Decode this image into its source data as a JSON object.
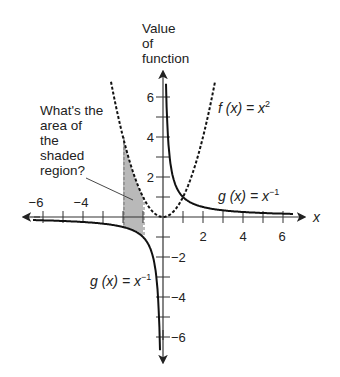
{
  "chart_data": {
    "type": "line",
    "title": "",
    "xlabel": "x",
    "ylabel": "Value of function",
    "ylabel_lines": [
      "Value",
      "of",
      "function"
    ],
    "xlim": [
      -7,
      7
    ],
    "ylim": [
      -7,
      7
    ],
    "x_tick_labels": [
      "-6",
      "-4",
      "2",
      "4",
      "6"
    ],
    "x_tick_values": [
      -6,
      -4,
      2,
      4,
      6
    ],
    "y_tick_labels": [
      "6",
      "4",
      "2",
      "-2",
      "-4",
      "-6"
    ],
    "y_tick_values": [
      6,
      4,
      2,
      -2,
      -4,
      -6
    ],
    "grid": false,
    "series": [
      {
        "name": "f(x) = x^2",
        "label_main": "f (x) = x",
        "label_sup": "2",
        "style": "dashed",
        "domain": [
          -2.6,
          2.6
        ],
        "x": [
          -2.6,
          -2,
          -1.5,
          -1,
          -0.5,
          0,
          0.5,
          1,
          1.5,
          2,
          2.6
        ],
        "values": [
          6.76,
          4,
          2.25,
          1,
          0.25,
          0,
          0.25,
          1,
          2.25,
          4,
          6.76
        ]
      },
      {
        "name": "g(x) = x^-1",
        "label_main": "g (x) = x",
        "label_sup": "−1",
        "style": "solid",
        "domain": [
          [
            -6.5,
            -0.15
          ],
          [
            0.15,
            6.5
          ]
        ],
        "x": [
          -6.5,
          -4,
          -2,
          -1,
          -0.5,
          -0.15,
          0.15,
          0.5,
          1,
          2,
          4,
          6.5
        ],
        "values": [
          -0.154,
          -0.25,
          -0.5,
          -1,
          -2,
          -6.67,
          6.67,
          2,
          1,
          0.5,
          0.25,
          0.154
        ]
      }
    ],
    "shaded_region": {
      "x_from": -2,
      "x_to": -1,
      "upper": "f(x) = x^2",
      "lower": "g(x) = x^-1"
    },
    "annotations": [
      {
        "text_lines": [
          "What's the",
          "area of",
          "the",
          "shaded",
          "region?"
        ],
        "points_to": "shaded_region"
      }
    ]
  },
  "labels": {
    "x_axis": "x",
    "ylabel_lines": [
      "Value",
      "of",
      "function"
    ],
    "f_main": "f (x) = x",
    "f_sup": "2",
    "g_upper_main": "g (x) = x",
    "g_upper_sup": "−1",
    "g_lower_main": "g (x) = x",
    "g_lower_sup": "−1",
    "question_lines": [
      "What's the",
      "area of",
      "the",
      "shaded",
      "region?"
    ],
    "x_ticks": [
      "−6",
      "−4",
      "2",
      "4",
      "6"
    ],
    "y_ticks": [
      "6",
      "4",
      "2",
      "−2",
      "−4",
      "−6"
    ]
  },
  "colors": {
    "ink": "#111111",
    "axis": "#333333",
    "shade": "#b9b9b9"
  }
}
